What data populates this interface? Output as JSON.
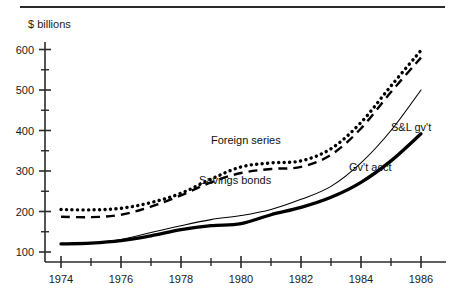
{
  "page": {
    "axis_unit_label": "$ billions",
    "background_color": "#ffffff",
    "ink_color": "#000000"
  },
  "chart_data": {
    "type": "line",
    "title": "",
    "subtitle": "",
    "xlabel": "",
    "ylabel": "$ billions",
    "grid": false,
    "legend_position": "inline-annotations",
    "xlim": [
      1974,
      1986.4
    ],
    "ylim": [
      75,
      625
    ],
    "x": [
      1974,
      1975,
      1976,
      1977,
      1978,
      1979,
      1980,
      1981,
      1982,
      1983,
      1984,
      1985,
      1986
    ],
    "xticks": [
      1974,
      1976,
      1978,
      1980,
      1982,
      1984,
      1986
    ],
    "xticklabels": [
      "1974",
      "1976",
      "1978",
      "1980",
      "1982",
      "1984",
      "1986"
    ],
    "xminorticks": [
      1975,
      1977,
      1979,
      1981,
      1983,
      1985
    ],
    "yticks": [
      100,
      200,
      300,
      400,
      500,
      600
    ],
    "yticklabels": [
      "100",
      "200",
      "300",
      "400",
      "500",
      "600"
    ],
    "yminorticks": [
      150,
      250,
      350,
      450,
      550
    ],
    "series": [
      {
        "name": "Foreign series",
        "style": "dotted",
        "label_x": 1979.0,
        "label_y": 366,
        "values": [
          205,
          204,
          208,
          222,
          245,
          280,
          310,
          320,
          325,
          355,
          420,
          510,
          598
        ]
      },
      {
        "name": "Savings bonds",
        "style": "dashed",
        "label_x": 1978.6,
        "label_y": 268,
        "values": [
          187,
          186,
          192,
          212,
          240,
          272,
          295,
          305,
          310,
          340,
          405,
          495,
          580
        ]
      },
      {
        "name": "S&L gv't",
        "style": "thin-solid",
        "label_x": 1985.0,
        "label_y": 400,
        "values": [
          119,
          122,
          131,
          148,
          165,
          180,
          190,
          205,
          230,
          262,
          320,
          400,
          500
        ]
      },
      {
        "name": "Gv't acct",
        "style": "thick-solid",
        "label_x": 1983.6,
        "label_y": 300,
        "values": [
          120,
          122,
          128,
          140,
          155,
          165,
          170,
          192,
          210,
          235,
          272,
          325,
          392
        ]
      }
    ]
  }
}
